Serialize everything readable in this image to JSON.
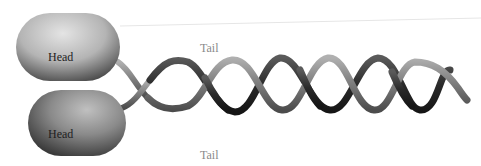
{
  "diagram": {
    "type": "myosin-dimer",
    "labels": {
      "head_top": "Head",
      "head_bottom": "Head",
      "tail_top": "Tail",
      "tail_bottom": "Tail"
    },
    "colors": {
      "head_light": "#d6d6d6",
      "head_dark": "#5a5a5a",
      "strand_a": "#8c8c8c",
      "strand_b": "#2e2e2e",
      "tail_label": "#8a8a8a",
      "head_label": "#1e1e1e"
    }
  }
}
